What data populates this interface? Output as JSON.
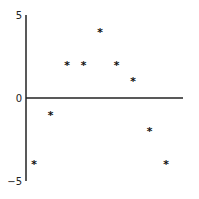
{
  "chart_data": {
    "type": "scatter",
    "title": "",
    "xlabel": "",
    "ylabel": "",
    "x": [
      1,
      2,
      3,
      4,
      5,
      6,
      7,
      8,
      9
    ],
    "series": [
      {
        "name": "",
        "marker": "*",
        "values": [
          -4,
          -1,
          2,
          2,
          4,
          2,
          1,
          -2,
          -4
        ]
      }
    ],
    "ylim": [
      -5,
      5
    ],
    "xlim": [
      0.5,
      9.9
    ],
    "yticks": [
      {
        "value": 5,
        "label": "5"
      },
      {
        "value": 0,
        "label": "0"
      },
      {
        "value": -5,
        "label": "−5"
      }
    ],
    "xticks": [],
    "grid": false,
    "legend": null,
    "axis_color": "#222222",
    "marker_color": "#111111"
  }
}
